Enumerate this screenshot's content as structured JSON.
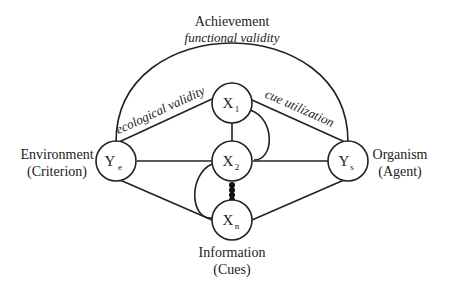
{
  "diagram": {
    "title": "Achievement",
    "subtitle": "functional validity",
    "left_label": {
      "line1": "Environment",
      "line2": "(Criterion)"
    },
    "right_label": {
      "line1": "Organism",
      "line2": "(Agent)"
    },
    "bottom_label": {
      "line1": "Information",
      "line2": "(Cues)"
    },
    "edge_labels": {
      "left": "ecological validity",
      "right": "cue utilization"
    },
    "nodes": [
      {
        "id": "Ye",
        "main": "Y",
        "sub": "e"
      },
      {
        "id": "X1",
        "main": "X",
        "sub": "1"
      },
      {
        "id": "X2",
        "main": "X",
        "sub": "2"
      },
      {
        "id": "Xn",
        "main": "X",
        "sub": "n"
      },
      {
        "id": "Ys",
        "main": "Y",
        "sub": "s"
      }
    ],
    "ellipsis_dots": 4
  }
}
